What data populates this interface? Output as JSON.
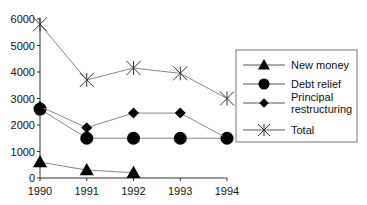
{
  "chart_data": {
    "type": "line",
    "title": "",
    "xlabel": "",
    "ylabel": "",
    "x": [
      1990,
      1991,
      1992,
      1993,
      1994
    ],
    "x_tick_labels": [
      "1990",
      "1991",
      "1992",
      "1993",
      "1994"
    ],
    "y_tick_labels": [
      "0",
      "1000",
      "2000",
      "3000",
      "4000",
      "5000",
      "6000"
    ],
    "ylim": [
      0,
      6000
    ],
    "grid": false,
    "legend_position": "right",
    "series": [
      {
        "name": "New money",
        "marker": "triangle",
        "values": [
          600,
          300,
          200,
          null,
          null
        ]
      },
      {
        "name": "Debt relief",
        "marker": "circle",
        "values": [
          2600,
          1500,
          1500,
          1500,
          1500
        ]
      },
      {
        "name": "Principal restructuring",
        "marker": "diamond",
        "values": [
          2700,
          1900,
          2450,
          2450,
          1500
        ]
      },
      {
        "name": "Total",
        "marker": "asterisk",
        "values": [
          5800,
          3700,
          4150,
          3950,
          3000
        ]
      }
    ],
    "colors": {
      "line": "#888888",
      "marker": "#000000",
      "axis": "#333333",
      "legend_border": "#777777"
    }
  },
  "legend": {
    "items": [
      {
        "label_lines": [
          "New money"
        ]
      },
      {
        "label_lines": [
          "Debt relief"
        ]
      },
      {
        "label_lines": [
          "Principal",
          "restructuring"
        ]
      },
      {
        "label_lines": [
          "Total"
        ]
      }
    ]
  }
}
